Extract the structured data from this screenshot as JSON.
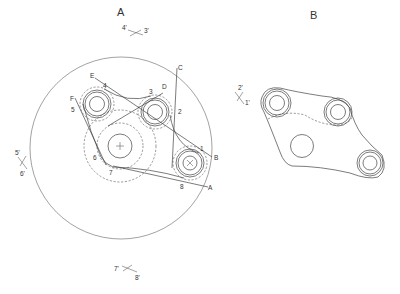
{
  "figures": {
    "a": {
      "title": "A",
      "marks": {
        "top": [
          "4'",
          "3'"
        ],
        "left": [
          "5'",
          "6'"
        ],
        "bottom": [
          "7'",
          "8'"
        ]
      },
      "points": [
        "1",
        "2",
        "3",
        "4",
        "5",
        "6",
        "7",
        "8"
      ],
      "lines": [
        "A",
        "B",
        "C",
        "D",
        "E",
        "F"
      ]
    },
    "b": {
      "title": "B",
      "marks": [
        "2'",
        "1'"
      ]
    }
  },
  "colors": {
    "ink": "#444444",
    "background": "#ffffff"
  }
}
